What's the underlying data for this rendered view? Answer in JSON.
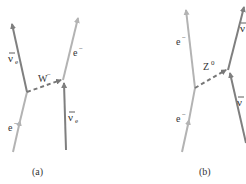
{
  "colors": {
    "light_line": "#b3b3b3",
    "dark_line": "#7f7f7f",
    "dashed": "#777777",
    "text": "#333333"
  },
  "diagram_a": {
    "caption": "(a)",
    "boson": {
      "symbol": "W",
      "sup": "−"
    },
    "labels": {
      "outgoing_left": {
        "base": "ν",
        "sub": "e",
        "bar": true
      },
      "outgoing_right": {
        "base": "e",
        "sup": "−"
      },
      "incoming_left": {
        "base": "e",
        "sup": "−"
      },
      "incoming_right": {
        "base": "ν",
        "sub": "e",
        "bar": true
      }
    }
  },
  "diagram_b": {
    "caption": "(b)",
    "boson": {
      "symbol": "Z",
      "sup": "0"
    },
    "labels": {
      "outgoing_left": {
        "base": "e",
        "sup": "−"
      },
      "incoming_left": {
        "base": "e",
        "sup": "−"
      },
      "outgoing_right": {
        "base": "ν",
        "bar": true
      },
      "incoming_right": {
        "base": "ν",
        "bar": true
      }
    }
  }
}
